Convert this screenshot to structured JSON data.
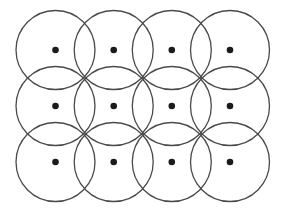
{
  "diagram": {
    "type": "overlapping-circles-grid",
    "rows": 3,
    "cols": 4,
    "canvas": {
      "width": 283,
      "height": 216
    },
    "circle_radius": 39.5,
    "dot_radius": 3.3,
    "col_x": [
      55.5,
      113.7,
      171.8,
      230
    ],
    "row_y": [
      50,
      106,
      162
    ],
    "stroke_width": 1.3,
    "colors": {
      "background": "#ffffff",
      "circle_stroke": "#4a4a4a",
      "dot_fill": "#1b1b1b"
    }
  }
}
